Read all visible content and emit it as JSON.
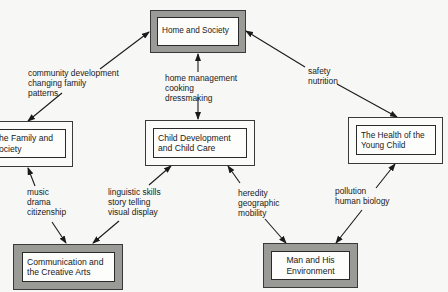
{
  "diagram": {
    "nodes": {
      "home_society": {
        "label": "Home and Society",
        "style": "shaded"
      },
      "family_society": {
        "label": "he Family and\nociety",
        "style": "plain"
      },
      "child_development": {
        "label": "Child Development\nand Child Care",
        "style": "plain"
      },
      "health_young_child": {
        "label": "The Health of the\nYoung Child",
        "style": "plain"
      },
      "communication_arts": {
        "label": "Communication and\nthe Creative Arts",
        "style": "shaded"
      },
      "man_environment": {
        "label": "Man and His\nEnvironment",
        "style": "shaded"
      }
    },
    "edges": [
      {
        "from": "home_society",
        "to": "family_society",
        "label": "community development\nchanging family\npatterns"
      },
      {
        "from": "home_society",
        "to": "child_development",
        "label": "home management\ncooking\ndressmaking"
      },
      {
        "from": "home_society",
        "to": "health_young_child",
        "label": "safety\nnutrition"
      },
      {
        "from": "family_society",
        "to": "communication_arts",
        "label": "music\ndrama\ncitizenship"
      },
      {
        "from": "child_development",
        "to": "communication_arts",
        "label": "linguistic skills\nstory telling\nvisual display"
      },
      {
        "from": "child_development",
        "to": "man_environment",
        "label": "heredity\ngeographic\nmobility"
      },
      {
        "from": "health_young_child",
        "to": "man_environment",
        "label": "pollution\nhuman biology"
      }
    ]
  },
  "colors": {
    "line": "#1a1a1a",
    "shade": "#9a9a96",
    "background": "#f7f7f5"
  }
}
